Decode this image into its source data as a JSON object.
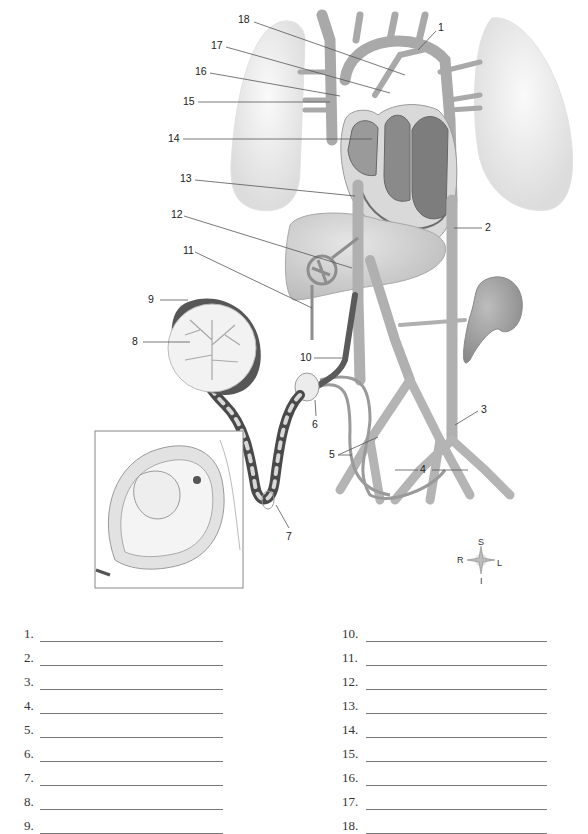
{
  "diagram": {
    "labels": [
      {
        "n": "1",
        "x": 438,
        "y": 27
      },
      {
        "n": "2",
        "x": 485,
        "y": 223
      },
      {
        "n": "3",
        "x": 481,
        "y": 406
      },
      {
        "n": "4",
        "x": 421,
        "y": 466
      },
      {
        "n": "5",
        "x": 330,
        "y": 451
      },
      {
        "n": "6",
        "x": 312,
        "y": 421
      },
      {
        "n": "7",
        "x": 286,
        "y": 533
      },
      {
        "n": "8",
        "x": 132,
        "y": 338
      },
      {
        "n": "9",
        "x": 148,
        "y": 296
      },
      {
        "n": "10",
        "x": 300,
        "y": 354
      },
      {
        "n": "11",
        "x": 183,
        "y": 246
      },
      {
        "n": "12",
        "x": 171,
        "y": 210
      },
      {
        "n": "13",
        "x": 180,
        "y": 174
      },
      {
        "n": "14",
        "x": 168,
        "y": 134
      },
      {
        "n": "15",
        "x": 183,
        "y": 96
      },
      {
        "n": "16",
        "x": 195,
        "y": 67
      },
      {
        "n": "17",
        "x": 211,
        "y": 41
      },
      {
        "n": "18",
        "x": 238,
        "y": 15
      }
    ],
    "structures": [
      "right lung",
      "left lung",
      "heart",
      "aortic arch",
      "superior vena cava",
      "liver",
      "kidney",
      "placenta",
      "umbilical cord",
      "iliac arteries",
      "uterus with fetus inset"
    ],
    "compass": {
      "superior": "S",
      "inferior": "I",
      "right": "R",
      "left": "L"
    }
  },
  "answers": {
    "left": [
      {
        "num": "1.",
        "value": ""
      },
      {
        "num": "2.",
        "value": ""
      },
      {
        "num": "3.",
        "value": ""
      },
      {
        "num": "4.",
        "value": ""
      },
      {
        "num": "5.",
        "value": ""
      },
      {
        "num": "6.",
        "value": ""
      },
      {
        "num": "7.",
        "value": ""
      },
      {
        "num": "8.",
        "value": ""
      },
      {
        "num": "9.",
        "value": ""
      }
    ],
    "right": [
      {
        "num": "10.",
        "value": ""
      },
      {
        "num": "11.",
        "value": ""
      },
      {
        "num": "12.",
        "value": ""
      },
      {
        "num": "13.",
        "value": ""
      },
      {
        "num": "14.",
        "value": ""
      },
      {
        "num": "15.",
        "value": ""
      },
      {
        "num": "16.",
        "value": ""
      },
      {
        "num": "17.",
        "value": ""
      },
      {
        "num": "18.",
        "value": ""
      }
    ]
  },
  "colors": {
    "vessel": "#b8b8b8",
    "vessel_dark": "#7a7a7a",
    "lung": "#eeeeee",
    "heart": "#8c8c8c",
    "liver": "#cfcfcf",
    "kidney": "#a0a0a0",
    "placenta_rim": "#555555",
    "line": "#777777"
  }
}
